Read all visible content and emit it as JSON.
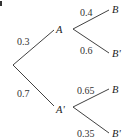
{
  "diagram": {
    "type": "probability-tree",
    "corner_label": "a",
    "root": {
      "x": 13,
      "y": 65
    },
    "first_level": [
      {
        "event": "A",
        "probability": "0.3",
        "node": {
          "x": 54,
          "y": 30
        },
        "label_pos": {
          "x": 56,
          "y": 33
        },
        "prob_pos": {
          "x": 17,
          "y": 45
        },
        "children": [
          {
            "event": "B",
            "probability": "0.4",
            "end": {
              "x": 109,
              "y": 10
            },
            "label_pos": {
              "x": 112,
              "y": 13
            },
            "prob_pos": {
              "x": 80,
              "y": 16
            }
          },
          {
            "event": "B'",
            "probability": "0.6",
            "end": {
              "x": 109,
              "y": 53
            },
            "label_pos": {
              "x": 112,
              "y": 57
            },
            "prob_pos": {
              "x": 80,
              "y": 54
            }
          }
        ]
      },
      {
        "event": "A'",
        "probability": "0.7",
        "node": {
          "x": 54,
          "y": 106
        },
        "label_pos": {
          "x": 56,
          "y": 113
        },
        "prob_pos": {
          "x": 17,
          "y": 97
        },
        "children": [
          {
            "event": "B",
            "probability": "0.65",
            "end": {
              "x": 109,
              "y": 89
            },
            "label_pos": {
              "x": 112,
              "y": 93
            },
            "prob_pos": {
              "x": 77,
              "y": 94
            }
          },
          {
            "event": "B'",
            "probability": "0.35",
            "end": {
              "x": 109,
              "y": 133
            },
            "label_pos": {
              "x": 112,
              "y": 137
            },
            "prob_pos": {
              "x": 77,
              "y": 137
            }
          }
        ]
      }
    ]
  }
}
